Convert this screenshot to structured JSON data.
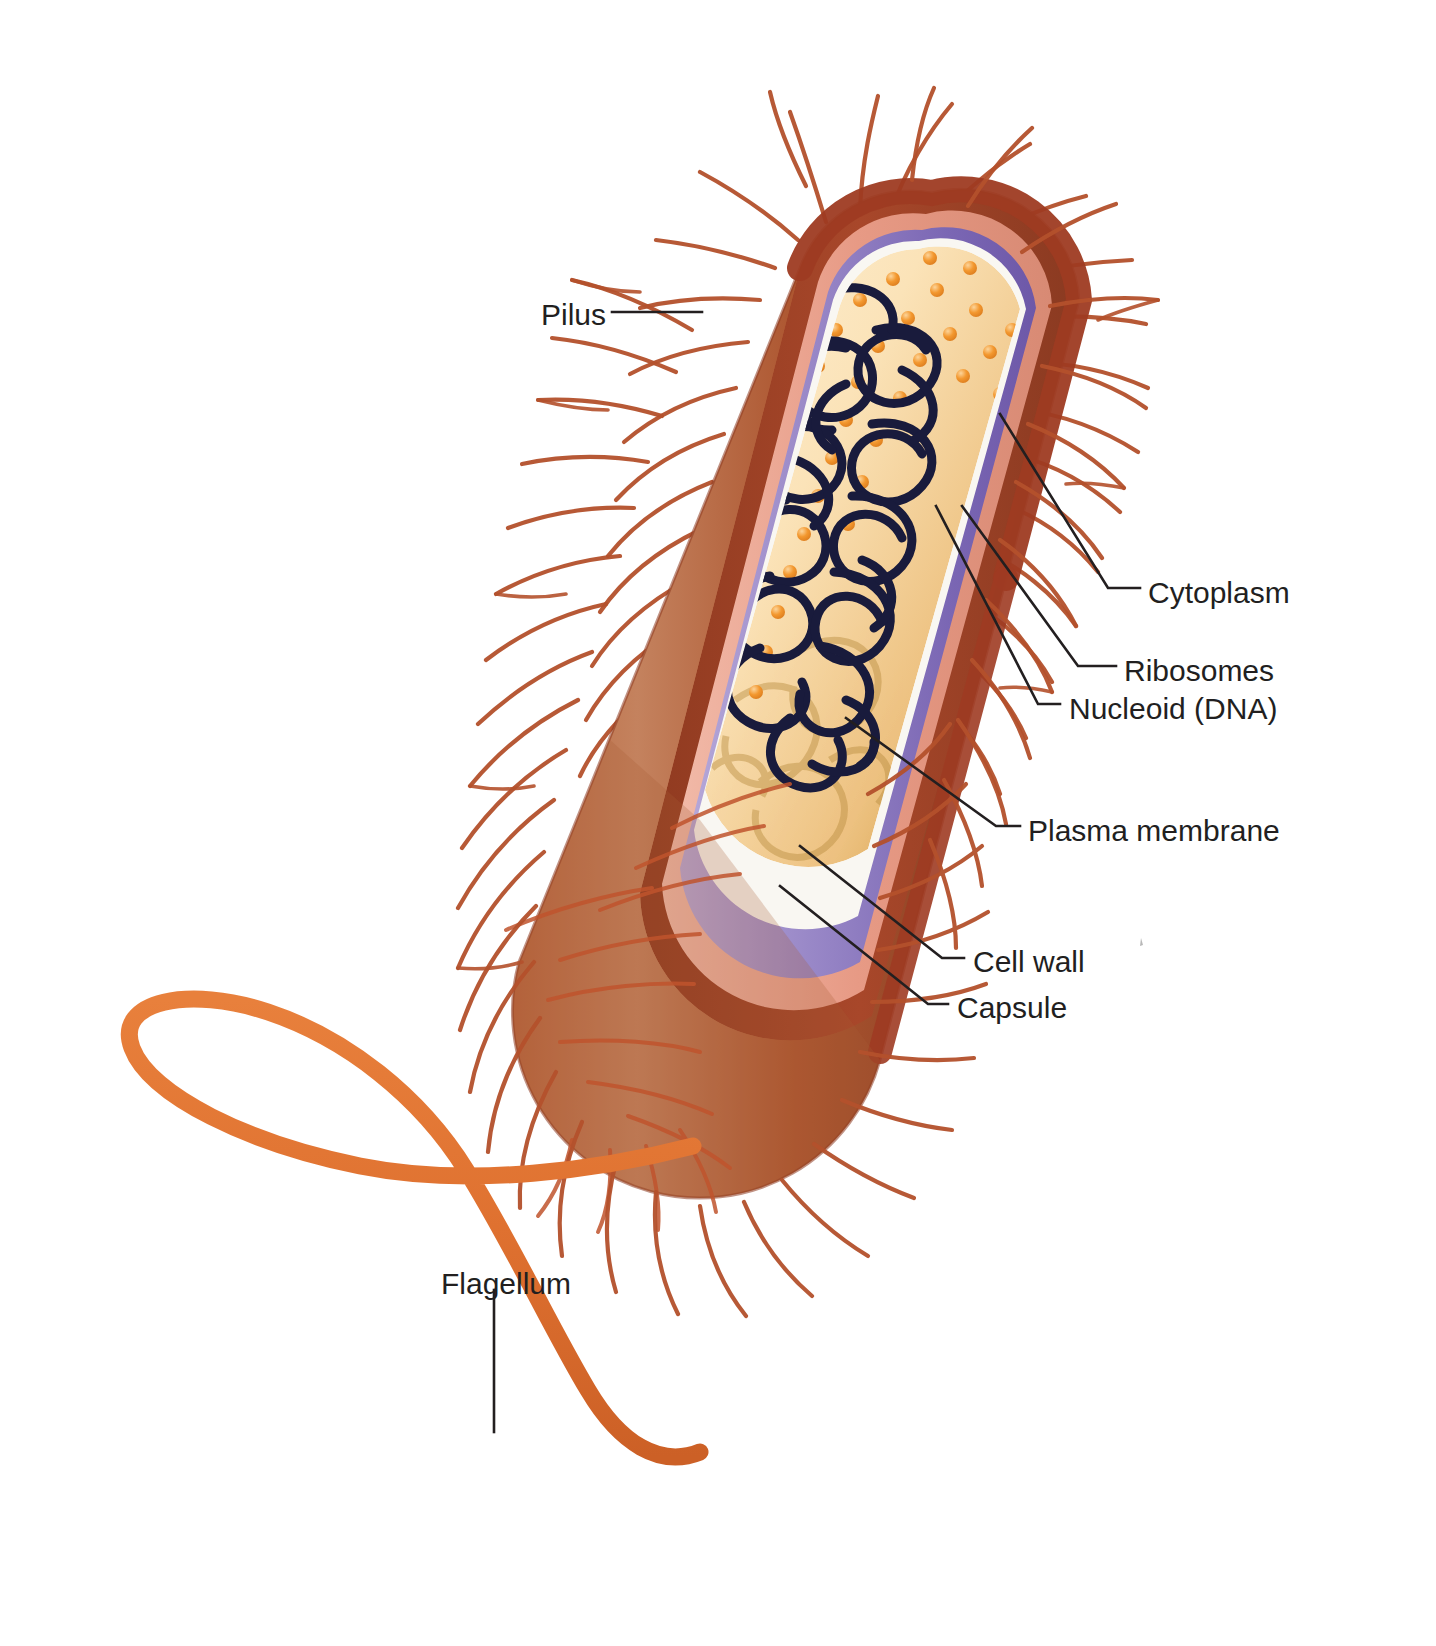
{
  "diagram": {
    "background": "#ffffff",
    "label_color": "#221f1f",
    "leader_color": "#231f20"
  },
  "palette": {
    "capsule_outer": "#9e3b22",
    "capsule_mid": "#b4512c",
    "capsule_body_light": "#c27a56",
    "capsule_body_dark": "#8d4327",
    "cell_wall": "#e8a08c",
    "cell_wall_light": "#f0b8a6",
    "plasma_membrane": "#8b7ac0",
    "plasma_membrane_light": "#b3a5d6",
    "plasma_membrane_dark": "#6f5ca8",
    "membrane_rim": "#f7f5f1",
    "cytoplasm_light": "#fbe8c4",
    "cytoplasm_mid": "#f3cd8e",
    "cytoplasm_dark": "#c99435",
    "ribosome": "#f0922e",
    "ribosome_light": "#f8c07a",
    "nucleoid": "#191b3c",
    "pilus": "#b4512c",
    "flagellum": "#df7130"
  },
  "labels": [
    {
      "id": "pilus",
      "text": "Pilus",
      "side": "left",
      "x": 541,
      "y": 300
    },
    {
      "id": "cytoplasm",
      "text": "Cytoplasm",
      "side": "right",
      "x": 1148,
      "y": 578
    },
    {
      "id": "ribosomes",
      "text": "Ribosomes",
      "side": "right",
      "x": 1124,
      "y": 656
    },
    {
      "id": "nucleoid",
      "text": "Nucleoid (DNA)",
      "side": "right",
      "x": 1069,
      "y": 694
    },
    {
      "id": "plasma-membrane",
      "text": "Plasma membrane",
      "side": "right",
      "x": 1028,
      "y": 816
    },
    {
      "id": "cell-wall",
      "text": "Cell wall",
      "side": "right",
      "x": 973,
      "y": 947
    },
    {
      "id": "capsule",
      "text": "Capsule",
      "side": "right",
      "x": 957,
      "y": 993
    },
    {
      "id": "flagellum",
      "text": "Flagellum",
      "side": "left",
      "x": 441,
      "y": 1269
    }
  ],
  "structures": {
    "capsule": "outermost brown-red sheath",
    "cell_wall": "salmon pink layer beneath capsule",
    "plasma_membrane": "purple layer inside cell wall",
    "cytoplasm": "cream-gold interior",
    "ribosomes": "orange spheres distributed in cytoplasm",
    "nucleoid": "dark navy looped DNA strand",
    "pili": "numerous thin red-brown hairs over the surface",
    "flagellum": "single thick orange whip-like tail at lower pole"
  }
}
